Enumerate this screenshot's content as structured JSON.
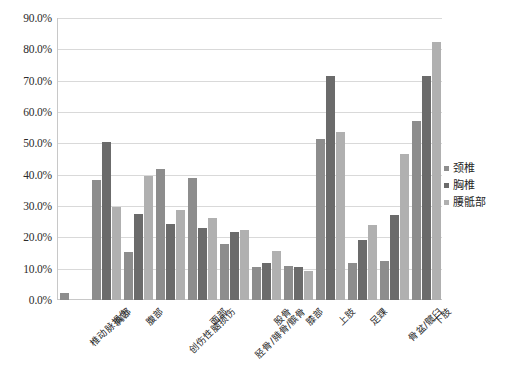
{
  "chart_data": {
    "type": "bar",
    "title": "",
    "subtitle": "",
    "xlabel": "",
    "ylabel": "",
    "ylim": [
      0,
      90
    ],
    "ytick_labels": [
      "0.0%",
      "10.0%",
      "20.0%",
      "30.0%",
      "40.0%",
      "50.0%",
      "60.0%",
      "70.0%",
      "80.0%",
      "90.0%"
    ],
    "ytick_values": [
      0,
      10,
      20,
      30,
      40,
      50,
      60,
      70,
      80,
      90
    ],
    "grid": true,
    "legend_position": "right",
    "value_unit": "%",
    "categories": [
      "椎动脉损伤",
      "胸部",
      "腹部",
      "创伤性脑损伤",
      "面部",
      "胫骨/腓骨/髌骨",
      "股骨",
      "膝部",
      "上肢",
      "足踝",
      "骨盆/髋臼",
      "下肢"
    ],
    "series": [
      {
        "name": "颈椎",
        "color": "#8d8d8d",
        "values": [
          2.3,
          38.2,
          15.2,
          41.8,
          38.8,
          17.8,
          10.4,
          10.8,
          51.5,
          11.9,
          12.4,
          57.2
        ]
      },
      {
        "name": "胸椎",
        "color": "#6b6b6b",
        "values": [
          0.0,
          50.3,
          27.4,
          24.2,
          23.0,
          21.7,
          11.8,
          10.4,
          71.5,
          19.2,
          27.2,
          71.5
        ]
      },
      {
        "name": "腰骶部",
        "color": "#b0b0b0",
        "values": [
          0.0,
          29.8,
          39.6,
          28.8,
          26.3,
          22.5,
          15.6,
          9.4,
          53.5,
          24.1,
          46.7,
          82.5
        ]
      }
    ]
  },
  "legend": {
    "items": [
      {
        "label": "颈椎"
      },
      {
        "label": "胸椎"
      },
      {
        "label": "腰骶部"
      }
    ]
  }
}
